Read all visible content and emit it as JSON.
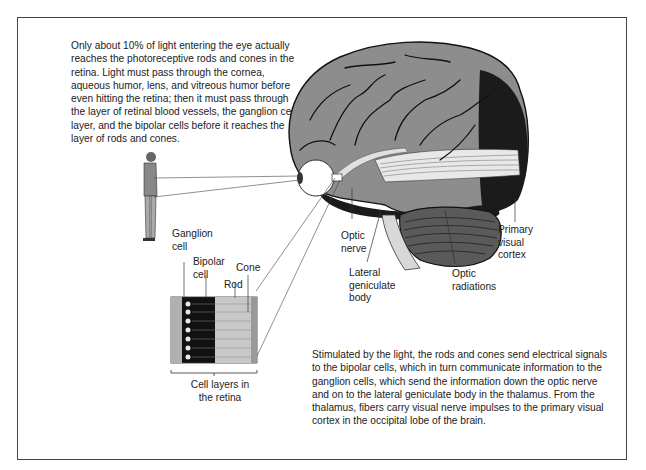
{
  "figure": {
    "top_caption": "Only about 10% of light entering the eye actually reaches the photoreceptive rods and cones in the retina. Light must pass through the cornea, aqueous humor, lens, and vitreous humor before even hitting the retina; then it must pass through the layer of retinal blood vessels, the ganglion cell layer, and the bipolar cells before it reaches the layer of rods and cones.",
    "bottom_caption": "Stimulated by the light, the rods and cones send electrical signals to the bipolar cells, which in turn communicate information to the ganglion cells, which send the information down the optic nerve and on to the lateral geniculate body in the thalamus. From the thalamus, fibers carry visual nerve impulses to the primary visual cortex in the occipital lobe of the brain.",
    "labels": {
      "ganglion_cell": [
        "Ganglion",
        "cell"
      ],
      "bipolar_cell": [
        "Bipolar",
        "cell"
      ],
      "cone": "Cone",
      "rod": "Rod",
      "cell_layers": [
        "Cell layers in",
        "the retina"
      ],
      "optic_nerve": [
        "Optic",
        "nerve"
      ],
      "lateral_geniculate_body": [
        "Lateral",
        "geniculate",
        "body"
      ],
      "optic_radiations": [
        "Optic",
        "radiations"
      ],
      "primary_visual_cortex": [
        "Primary",
        "visual",
        "cortex"
      ]
    }
  }
}
